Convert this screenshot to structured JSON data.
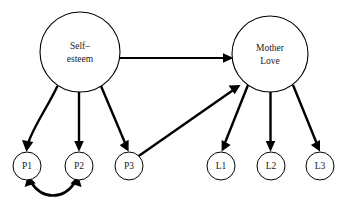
{
  "figure": {
    "type": "path-diagram",
    "background_color": "#ffffff",
    "line_color": "#000000",
    "text_color": "#1a1a1a",
    "width": 351,
    "height": 214
  },
  "nodes": {
    "latent": [
      {
        "id": "self-esteem",
        "label_line1": "Self–",
        "label_line2": "esteem",
        "cx": 80,
        "cy": 52,
        "r": 40
      },
      {
        "id": "mother-love",
        "label_line1": "Mother",
        "label_line2": "Love",
        "cx": 270,
        "cy": 54,
        "r": 38
      }
    ],
    "indicators": [
      {
        "id": "p1",
        "label": "P1",
        "cx": 27,
        "cy": 166,
        "r": 14
      },
      {
        "id": "p2",
        "label": "P2",
        "cx": 79,
        "cy": 166,
        "r": 14
      },
      {
        "id": "p3",
        "label": "P3",
        "cx": 129,
        "cy": 166,
        "r": 14
      },
      {
        "id": "l1",
        "label": "L1",
        "cx": 221,
        "cy": 166,
        "r": 14
      },
      {
        "id": "l2",
        "label": "L2",
        "cx": 271,
        "cy": 166,
        "r": 14
      },
      {
        "id": "l3",
        "label": "L3",
        "cx": 320,
        "cy": 166,
        "r": 14
      }
    ]
  },
  "edges": [
    {
      "id": "self-esteem-to-mother-love",
      "from": "self-esteem",
      "to": "mother-love",
      "kind": "directed"
    },
    {
      "id": "self-esteem-to-p1",
      "from": "self-esteem",
      "to": "p1",
      "kind": "directed"
    },
    {
      "id": "self-esteem-to-p2",
      "from": "self-esteem",
      "to": "p2",
      "kind": "directed"
    },
    {
      "id": "self-esteem-to-p3",
      "from": "self-esteem",
      "to": "p3",
      "kind": "directed"
    },
    {
      "id": "p3-to-mother-love",
      "from": "p3",
      "to": "mother-love",
      "kind": "directed"
    },
    {
      "id": "mother-love-to-l1",
      "from": "mother-love",
      "to": "l1",
      "kind": "directed"
    },
    {
      "id": "mother-love-to-l2",
      "from": "mother-love",
      "to": "l2",
      "kind": "directed"
    },
    {
      "id": "mother-love-to-l3",
      "from": "mother-love",
      "to": "l3",
      "kind": "directed"
    },
    {
      "id": "p1-p2-correlation",
      "from": "p1",
      "to": "p2",
      "kind": "bidirectional-curved"
    }
  ]
}
